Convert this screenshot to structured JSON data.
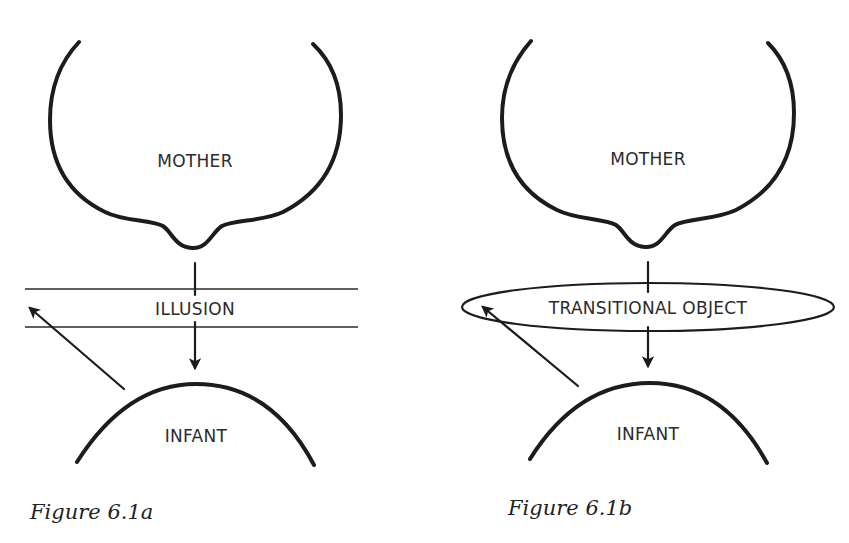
{
  "figures": [
    {
      "id": "6.1a",
      "caption": "Figure 6.1a",
      "top_node": "MOTHER",
      "middle_label": "ILLUSION",
      "middle_shape": "band-between-two-horizontal-lines",
      "bottom_node": "INFANT",
      "arrows": [
        {
          "from": "MOTHER",
          "to": "ILLUSION/INFANT",
          "direction": "down"
        },
        {
          "from": "INFANT",
          "to": "left-edge-of-band",
          "direction": "up-left"
        }
      ]
    },
    {
      "id": "6.1b",
      "caption": "Figure 6.1b",
      "top_node": "MOTHER",
      "middle_label": "TRANSITIONAL OBJECT",
      "middle_shape": "ellipse",
      "bottom_node": "INFANT",
      "arrows": [
        {
          "from": "MOTHER",
          "to": "TRANSITIONAL OBJECT/INFANT",
          "direction": "down"
        },
        {
          "from": "INFANT",
          "to": "left-edge-of-ellipse",
          "direction": "up-left"
        }
      ]
    }
  ],
  "colors": {
    "ink": "#1c1c1c",
    "background": "#ffffff"
  }
}
